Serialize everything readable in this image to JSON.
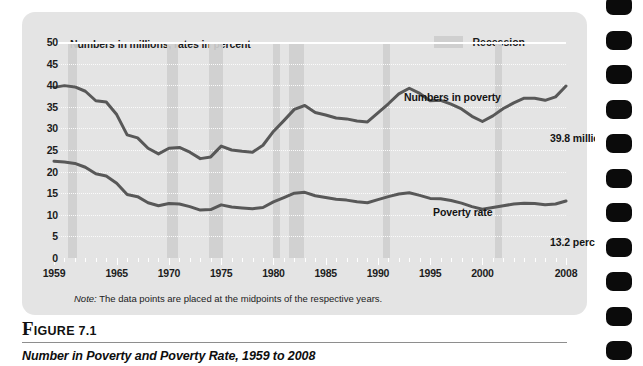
{
  "figure": {
    "number_prefix": "F",
    "number_rest": "IGURE 7.1",
    "title": "Number in Poverty and Poverty Rate, 1959 to 2008"
  },
  "chart_header": "Numbers in millions, rates in percent",
  "legend": {
    "recession_label": "Recession",
    "recession_color": "#cfcfcf"
  },
  "annotations": {
    "numbers_series": "Numbers in poverty",
    "rate_series": "Poverty rate",
    "end_numbers": "39.8 million",
    "end_rate": "13.2 percent"
  },
  "footnote": {
    "lead": "Note:",
    "text": " The data points are placed at the midpoints of the respective years."
  },
  "colors": {
    "card_background": "#e4e4e4",
    "line": "#585858",
    "gridline": "#fbfbfb",
    "axis": "#ffffff",
    "text": "#1b1b1b"
  },
  "chart_data": {
    "type": "line",
    "title": "Number in Poverty and Poverty Rate, 1959 to 2008",
    "subtitle": "Numbers in millions, rates in percent",
    "xlabel": "",
    "ylabel": "Numbers in millions, rates in percent",
    "xlim": [
      1959,
      2008
    ],
    "ylim": [
      0,
      50
    ],
    "yticks": [
      0,
      5,
      10,
      15,
      20,
      25,
      30,
      35,
      40,
      45,
      50
    ],
    "xticks": [
      1959,
      1965,
      1970,
      1975,
      1980,
      1985,
      1990,
      1995,
      2000,
      2008
    ],
    "xtick_labels": [
      "1959",
      "1965",
      "1970",
      "1975",
      "1980",
      "1985",
      "1990",
      "1995",
      "2000",
      "2008"
    ],
    "grid": true,
    "legend_position": "top-right",
    "x": [
      1959,
      1960,
      1961,
      1962,
      1963,
      1964,
      1965,
      1966,
      1967,
      1968,
      1969,
      1970,
      1971,
      1972,
      1973,
      1974,
      1975,
      1976,
      1977,
      1978,
      1979,
      1980,
      1981,
      1982,
      1983,
      1984,
      1985,
      1986,
      1987,
      1988,
      1989,
      1990,
      1991,
      1992,
      1993,
      1994,
      1995,
      1996,
      1997,
      1998,
      1999,
      2000,
      2001,
      2002,
      2003,
      2004,
      2005,
      2006,
      2007,
      2008
    ],
    "series": [
      {
        "name": "Numbers in poverty",
        "units": "millions",
        "end_label": "39.8 million",
        "values": [
          39.5,
          39.9,
          39.6,
          38.6,
          36.4,
          36.1,
          33.2,
          28.5,
          27.8,
          25.4,
          24.1,
          25.4,
          25.6,
          24.5,
          23.0,
          23.4,
          25.9,
          25.0,
          24.7,
          24.5,
          26.1,
          29.3,
          31.8,
          34.4,
          35.3,
          33.7,
          33.1,
          32.4,
          32.2,
          31.7,
          31.5,
          33.6,
          35.7,
          38.0,
          39.3,
          38.1,
          36.4,
          36.5,
          35.6,
          34.5,
          32.8,
          31.6,
          32.9,
          34.6,
          35.9,
          37.0,
          37.0,
          36.5,
          37.3,
          39.8
        ]
      },
      {
        "name": "Poverty rate",
        "units": "percent",
        "end_label": "13.2 percent",
        "values": [
          22.4,
          22.2,
          21.9,
          21.0,
          19.5,
          19.0,
          17.3,
          14.7,
          14.2,
          12.8,
          12.1,
          12.6,
          12.5,
          11.9,
          11.1,
          11.2,
          12.3,
          11.8,
          11.6,
          11.4,
          11.7,
          13.0,
          14.0,
          15.0,
          15.2,
          14.4,
          14.0,
          13.6,
          13.4,
          13.0,
          12.8,
          13.5,
          14.2,
          14.8,
          15.1,
          14.5,
          13.8,
          13.7,
          13.3,
          12.7,
          11.9,
          11.3,
          11.7,
          12.1,
          12.5,
          12.7,
          12.6,
          12.3,
          12.5,
          13.2
        ]
      }
    ],
    "recession_bands": [
      {
        "start": 1960.3,
        "end": 1961.2
      },
      {
        "start": 1969.8,
        "end": 1970.9
      },
      {
        "start": 1973.8,
        "end": 1975.2
      },
      {
        "start": 1980.0,
        "end": 1980.6
      },
      {
        "start": 1981.5,
        "end": 1982.9
      },
      {
        "start": 1990.5,
        "end": 1991.2
      },
      {
        "start": 2001.2,
        "end": 2001.9
      }
    ]
  }
}
